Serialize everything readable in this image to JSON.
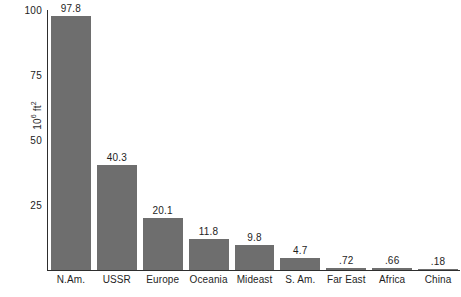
{
  "chart_data": {
    "type": "bar",
    "title": "",
    "subtitle": "",
    "xlabel": "",
    "ylabel": "10⁶ ft²",
    "ylabel_base": "10",
    "ylabel_exp": "6",
    "ylabel_unit": "ft",
    "ylabel_unit_exp": "2",
    "ylim": [
      0,
      100
    ],
    "yticks": [
      25,
      50,
      75,
      100
    ],
    "ytick_labels": [
      "25",
      "50",
      "75",
      "100"
    ],
    "grid": false,
    "legend": false,
    "categories": [
      "N.Am.",
      "USSR",
      "Europe",
      "Oceania",
      "Mideast",
      "S. Am.",
      "Far East",
      "Africa",
      "China"
    ],
    "values": [
      97.8,
      40.3,
      20.1,
      11.8,
      9.8,
      4.7,
      0.72,
      0.66,
      0.18
    ],
    "value_labels": [
      "97.8",
      "40.3",
      "20.1",
      "11.8",
      "9.8",
      "4.7",
      ".72",
      ".66",
      ".18"
    ],
    "bar_color": "#6e6e6e",
    "axis_color": "#2e2e2e",
    "text_color": "#1e1e1e",
    "background": "#ffffff"
  },
  "axis": {
    "y_tick_0": "100",
    "y_tick_1": "75",
    "y_tick_2": "50",
    "y_tick_3": "25"
  }
}
